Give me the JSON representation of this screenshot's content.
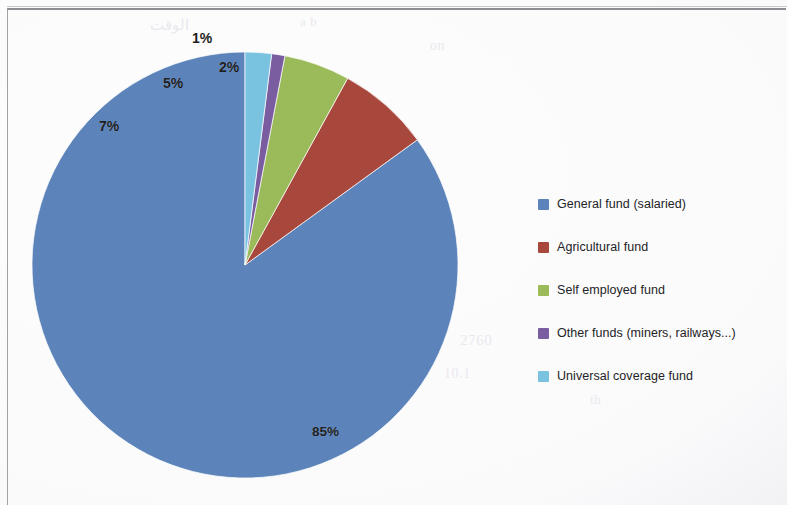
{
  "figure": {
    "kind": "pie-chart",
    "background_color": "#fdfdfd",
    "frame_color": "#8e8e92"
  },
  "chart_data": {
    "type": "pie",
    "title": "",
    "subtitle": "",
    "xlabel": "",
    "ylabel": "",
    "grid": false,
    "legend_position": "right",
    "units": "percent",
    "start_angle_deg": 0,
    "direction": "counterclockwise",
    "categories": [
      "General fund (salaried)",
      "Agricultural fund",
      "Self employed fund",
      "Other funds (miners, railways...)",
      "Universal coverage fund"
    ],
    "values": [
      85,
      7,
      5,
      1,
      2
    ],
    "data_labels": [
      "85%",
      "7%",
      "5%",
      "1%",
      "2%"
    ],
    "colors": [
      "#5c84ba",
      "#a8483c",
      "#9bba5a",
      "#7a5ca0",
      "#79c3e0"
    ],
    "slices": [
      {
        "label": "General fund (salaried)",
        "value": 85,
        "display": "85%",
        "color": "#5c84ba"
      },
      {
        "label": "Agricultural fund",
        "value": 7,
        "display": "7%",
        "color": "#a8483c"
      },
      {
        "label": "Self employed fund",
        "value": 5,
        "display": "5%",
        "color": "#9bba5a"
      },
      {
        "label": "Other funds (miners, railways...)",
        "value": 1,
        "display": "1%",
        "color": "#7a5ca0"
      },
      {
        "label": "Universal coverage fund",
        "value": 2,
        "display": "2%",
        "color": "#79c3e0"
      }
    ]
  },
  "legend": {
    "items": [
      {
        "label": "General fund (salaried)",
        "color": "#5c84ba"
      },
      {
        "label": "Agricultural fund",
        "color": "#a8483c"
      },
      {
        "label": "Self employed fund",
        "color": "#9bba5a"
      },
      {
        "label": "Other funds (miners, railways...)",
        "color": "#7a5ca0"
      },
      {
        "label": "Universal coverage fund",
        "color": "#79c3e0"
      }
    ]
  },
  "bleed_through": {
    "lines": [
      {
        "text": "الوقت",
        "x": 150,
        "y": 16,
        "size": 15
      },
      {
        "text": "a b",
        "x": 300,
        "y": 14,
        "size": 13
      },
      {
        "text": "on",
        "x": 430,
        "y": 38,
        "size": 14
      },
      {
        "text": "2760",
        "x": 460,
        "y": 332,
        "size": 15
      },
      {
        "text": "10.1",
        "x": 444,
        "y": 366,
        "size": 14
      },
      {
        "text": "th",
        "x": 590,
        "y": 392,
        "size": 13
      }
    ]
  }
}
